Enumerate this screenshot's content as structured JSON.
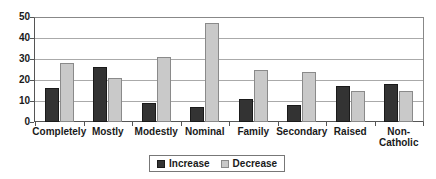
{
  "chart_data": {
    "type": "bar",
    "title": "",
    "xlabel": "",
    "ylabel": "",
    "ylim": [
      0,
      50
    ],
    "yticks": [
      0,
      10,
      20,
      30,
      40,
      50
    ],
    "grid": true,
    "legend_position": "bottom-center",
    "categories": [
      "Completely",
      "Mostly",
      "Modestly",
      "Nominal",
      "Family",
      "Secondary",
      "Raised",
      "Non-Catholic"
    ],
    "category_lines": [
      [
        "Completely"
      ],
      [
        "Mostly"
      ],
      [
        "Modestly"
      ],
      [
        "Nominal"
      ],
      [
        "Family"
      ],
      [
        "Secondary"
      ],
      [
        "Raised"
      ],
      [
        "Non-",
        "Catholic"
      ]
    ],
    "series": [
      {
        "name": "Increase",
        "color": "#333333",
        "values": [
          16,
          26,
          9,
          7,
          11,
          8,
          17,
          18
        ]
      },
      {
        "name": "Decrease",
        "color": "#c9c9c9",
        "values": [
          28,
          21,
          31,
          47,
          25,
          24,
          15,
          15
        ]
      }
    ]
  },
  "legend": {
    "items": [
      {
        "label": "Increase",
        "swatch": "increase"
      },
      {
        "label": "Decrease",
        "swatch": "decrease"
      }
    ]
  }
}
